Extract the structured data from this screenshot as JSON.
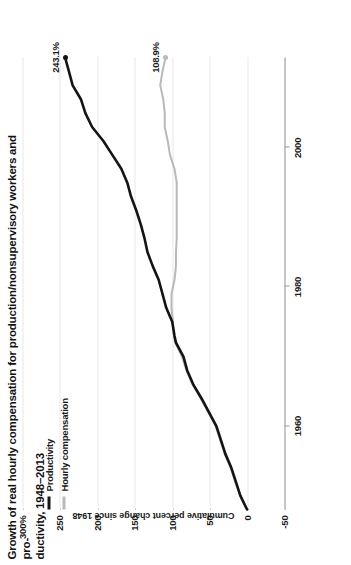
{
  "figure": {
    "title_line1": "Growth of real hourly compensation for production/nonsupervisory workers and pro-",
    "title_line2": "ductivity, 1948–2013"
  },
  "legend": {
    "position": "top-left",
    "items": [
      {
        "label": "Productivity",
        "color": "#141414",
        "icon": "line-swatch-icon"
      },
      {
        "label": "Hourly compensation",
        "color": "#b9b9b9",
        "icon": "line-swatch-icon"
      }
    ]
  },
  "chart_data": {
    "type": "line",
    "xlabel": "",
    "ylabel": "Cumulative percent change since 1948",
    "xlim": [
      1948,
      2013
    ],
    "ylim": [
      -50,
      300
    ],
    "yticks": [
      300,
      250,
      200,
      150,
      100,
      50,
      0,
      -50
    ],
    "ytick_labels": [
      "300%",
      "250",
      "200",
      "150",
      "100",
      "50",
      "0",
      "-50"
    ],
    "xticks": [
      1960,
      1980,
      2000
    ],
    "xtick_labels": [
      "1960",
      "1980",
      "2000"
    ],
    "grid": "horizontal-dotted",
    "legend_position": "top-left",
    "annotations": [
      {
        "text": "243.1%",
        "series": "Productivity",
        "x": 2013,
        "y": 243.1
      },
      {
        "text": "108.9%",
        "series": "Hourly compensation",
        "x": 2013,
        "y": 108.9
      }
    ],
    "x": [
      1948,
      1950,
      1952,
      1954,
      1956,
      1958,
      1960,
      1962,
      1964,
      1966,
      1968,
      1970,
      1972,
      1973,
      1975,
      1977,
      1979,
      1981,
      1983,
      1985,
      1987,
      1989,
      1991,
      1993,
      1995,
      1997,
      1999,
      2001,
      2003,
      2005,
      2007,
      2009,
      2011,
      2013
    ],
    "series": [
      {
        "name": "Productivity",
        "color": "#141414",
        "values": [
          0,
          9,
          15,
          21,
          29,
          35,
          41,
          51,
          61,
          72,
          80,
          85,
          95,
          97,
          100,
          108,
          113,
          118,
          126,
          133,
          137,
          142,
          148,
          155,
          160,
          168,
          180,
          192,
          207,
          216,
          222,
          233,
          238,
          243.1
        ]
      },
      {
        "name": "Hourly compensation",
        "color": "#b9b9b9",
        "values": [
          0,
          9,
          16,
          22,
          30,
          36,
          42,
          52,
          62,
          73,
          81,
          87,
          96,
          98,
          99,
          101,
          101,
          97,
          95,
          95,
          94,
          94,
          94,
          94,
          94,
          97,
          103,
          106,
          110,
          110,
          112,
          116,
          113,
          108.9
        ]
      }
    ]
  }
}
